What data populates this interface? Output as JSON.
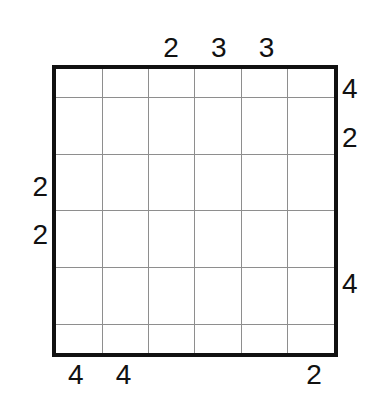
{
  "puzzle": {
    "type": "skyscrapers-grid",
    "size": {
      "rows": 6,
      "columns": 6
    },
    "colors": {
      "background": "#ffffff",
      "border": "#111111",
      "gridline": "#8e8e8e",
      "clue_text": "#111111"
    },
    "clues": {
      "top": [
        "",
        "",
        "2",
        "3",
        "3",
        ""
      ],
      "right": [
        "4",
        "2",
        "",
        "",
        "4",
        ""
      ],
      "bottom": [
        "4",
        "4",
        "",
        "",
        "",
        "2"
      ],
      "left": [
        "",
        "",
        "2",
        "2",
        "",
        ""
      ]
    },
    "cells": [
      [
        "",
        "",
        "",
        "",
        "",
        ""
      ],
      [
        "",
        "",
        "",
        "",
        "",
        ""
      ],
      [
        "",
        "",
        "",
        "",
        "",
        ""
      ],
      [
        "",
        "",
        "",
        "",
        "",
        ""
      ],
      [
        "",
        "",
        "",
        "",
        "",
        ""
      ],
      [
        "",
        "",
        "",
        "",
        "",
        ""
      ]
    ]
  }
}
